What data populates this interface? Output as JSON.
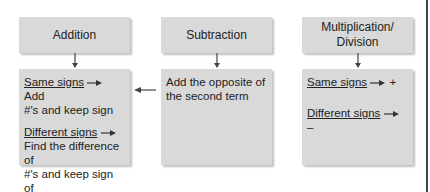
{
  "columns": [
    {
      "id": "addition",
      "header": "Addition",
      "body": {
        "rule1_label": "Same signs",
        "rule1_result_a": "Add",
        "rule1_result_b": "#'s and keep sign",
        "rule2_label": "Different signs",
        "rule2_result_lines": [
          "Find the difference of",
          "#'s and keep sign of",
          "# farthest from zero"
        ]
      }
    },
    {
      "id": "subtraction",
      "header": "Subtraction",
      "body": {
        "text_lines": [
          "Add the opposite of",
          "the second term"
        ]
      }
    },
    {
      "id": "multiplication-division",
      "header_lines": [
        "Multiplication/",
        "Division"
      ],
      "body": {
        "rule1_label": "Same signs",
        "rule1_result": "+",
        "rule2_label": "Different signs",
        "rule2_result": "–"
      }
    }
  ],
  "connectors": {
    "subtraction_to_addition_arrow": "left-arrow"
  },
  "colors": {
    "box_fill": "#d9d9d9",
    "text": "#222222",
    "arrow": "#444444"
  }
}
